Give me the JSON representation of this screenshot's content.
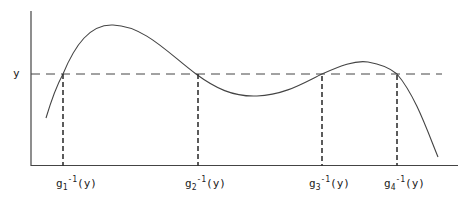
{
  "diagram": {
    "title": "",
    "y_axis_label": "y",
    "curve_label": "g(x)",
    "level_line": "horizontal dashed line at y",
    "roots": [
      {
        "base": "g",
        "sub": "1",
        "sup": "-1",
        "arg": "(y)"
      },
      {
        "base": "g",
        "sub": "2",
        "sup": "-1",
        "arg": "(y)"
      },
      {
        "base": "g",
        "sub": "3",
        "sup": "-1",
        "arg": "(y)"
      },
      {
        "base": "g",
        "sub": "4",
        "sup": "-1",
        "arg": "(y)"
      }
    ],
    "colors": {
      "line": "#333333",
      "background": "#ffffff"
    }
  }
}
